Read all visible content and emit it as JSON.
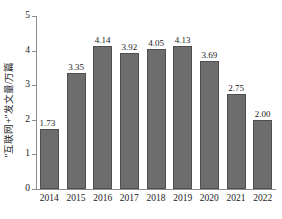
{
  "chart_data": {
    "type": "bar",
    "title": "",
    "xlabel": "",
    "ylabel": "\"互联网+\"发文量/万篇",
    "categories": [
      "2014",
      "2015",
      "2016",
      "2017",
      "2018",
      "2019",
      "2020",
      "2021",
      "2022"
    ],
    "values": [
      1.73,
      3.35,
      4.14,
      3.92,
      4.05,
      4.13,
      3.69,
      2.75,
      2.0
    ],
    "value_labels": [
      "1.73",
      "3.35",
      "4.14",
      "3.92",
      "4.05",
      "4.13",
      "3.69",
      "2.75",
      "2.00"
    ],
    "ylim": [
      0,
      5
    ],
    "yticks": [
      0,
      1,
      2,
      3,
      4,
      5
    ],
    "ytick_labels": [
      "0",
      "1",
      "2",
      "3",
      "4",
      "5"
    ],
    "grid": false,
    "legend": null,
    "series": [
      {
        "name": "\"互联网+\"发文量/万篇",
        "values": [
          1.73,
          3.35,
          4.14,
          3.92,
          4.05,
          4.13,
          3.69,
          2.75,
          2.0
        ],
        "color": "#6d6d6d"
      }
    ],
    "colors": {
      "bar_fill": "#6d6d6d",
      "bar_border": "#4f4f4f",
      "axis": "#8d8d8d",
      "text": "#1a1a1a",
      "background": "#ffffff"
    }
  }
}
